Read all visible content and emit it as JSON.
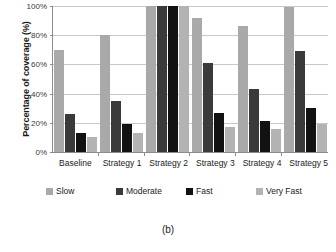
{
  "chart_data": {
    "type": "bar",
    "title": "",
    "xlabel": "",
    "ylabel": "Percentage of coverage (%)",
    "ylim": [
      0,
      100
    ],
    "yticks": [
      "0%",
      "20%",
      "40%",
      "60%",
      "80%",
      "100%"
    ],
    "ytick_values": [
      0,
      20,
      40,
      60,
      80,
      100
    ],
    "grid": true,
    "legend_position": "bottom",
    "categories": [
      "Baseline",
      "Strategy 1",
      "Strategy 2",
      "Strategy 3",
      "Strategy 4",
      "Strategy 5"
    ],
    "series": [
      {
        "name": "Slow",
        "color": "#a9a9a9",
        "values": [
          70,
          80,
          100,
          92,
          86,
          99
        ]
      },
      {
        "name": "Moderate",
        "color": "#3a3a3a",
        "values": [
          26,
          35,
          100,
          61,
          43,
          69
        ]
      },
      {
        "name": "Fast",
        "color": "#121212",
        "values": [
          13,
          19,
          100,
          27,
          21,
          30
        ]
      },
      {
        "name": "Very Fast",
        "color": "#b3b3b3",
        "values": [
          10,
          13,
          100,
          17,
          16,
          19
        ]
      }
    ]
  },
  "caption": "(b)"
}
